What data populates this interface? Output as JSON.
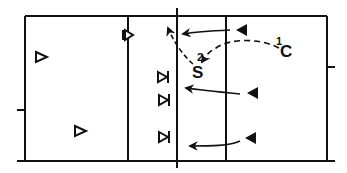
{
  "diagram": {
    "type": "volleyball-court-play-diagram",
    "colors": {
      "line": "#111111",
      "background": "#ffffff"
    },
    "court": {
      "left": 25,
      "top": 16,
      "right": 327,
      "bottom": 161,
      "attack_line_left": 128,
      "center_line": 177,
      "attack_line_right": 226
    },
    "labels": {
      "setter": "S",
      "setter_step": "2",
      "coach": "C",
      "coach_step": "1"
    },
    "players": {
      "defense_open_triangles": [
        {
          "x": 40,
          "y": 57
        },
        {
          "x": 79,
          "y": 131
        },
        {
          "x": 126,
          "y": 35
        }
      ],
      "blockers": [
        {
          "x": 162,
          "y": 77
        },
        {
          "x": 163,
          "y": 100
        },
        {
          "x": 163,
          "y": 137
        }
      ],
      "hitters_filled_triangles": [
        {
          "x": 241,
          "y": 30
        },
        {
          "x": 252,
          "y": 93
        },
        {
          "x": 250,
          "y": 138
        }
      ]
    },
    "legend_semantics": {
      "open_triangle": "defender",
      "triangle_with_bar": "blocker",
      "filled_triangle": "attacker",
      "dashed_arrow": "ball path",
      "solid_arrow": "player movement"
    }
  }
}
